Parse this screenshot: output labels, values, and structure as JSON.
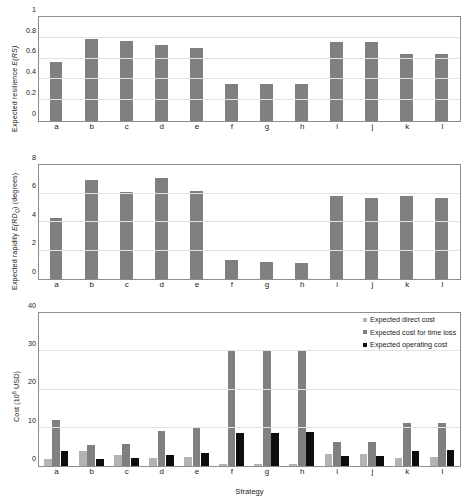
{
  "figure": {
    "xaxis_title": "Strategy",
    "categories": [
      "a",
      "b",
      "c",
      "d",
      "e",
      "f",
      "g",
      "h",
      "i",
      "j",
      "k",
      "l"
    ]
  },
  "colors": {
    "bar_gray": "#808080",
    "direct_cost": "#b3b3b3",
    "time_loss_cost": "#808080",
    "operating_cost": "#0d0d0d",
    "axis": "#8c8c8c",
    "grid": "#e2e2e2",
    "text": "#1a1a1a"
  },
  "panels": {
    "resilience": {
      "ylabel_parts": {
        "pre": "Expected resilience ",
        "ital": "E(RS)",
        "post": ""
      },
      "ticks": [
        "0",
        "0.2",
        "0.4",
        "0.6",
        "0.8",
        "1"
      ]
    },
    "rapidity": {
      "ylabel_parts": {
        "pre": "Expected rapidity ",
        "ital": "E(RD",
        "sub": "Q",
        "post": ") (degrees)"
      },
      "ticks": [
        "0",
        "2",
        "4",
        "6",
        "8"
      ]
    },
    "cost": {
      "ylabel_parts": {
        "pre": "Cost (10",
        "sup": "6",
        "post": " USD)"
      },
      "ticks": [
        "0",
        "10",
        "20",
        "30",
        "40"
      ]
    }
  },
  "legend": {
    "items": [
      {
        "label": "Expected direct cost",
        "color": "#b3b3b3"
      },
      {
        "label": "Expected cost for time loss",
        "color": "#808080"
      },
      {
        "label": "Expected operating cost",
        "color": "#0d0d0d"
      }
    ]
  },
  "chart_data": [
    {
      "type": "bar",
      "title": "Expected resilience by strategy",
      "xlabel": "",
      "ylabel": "Expected resilience E(RS)",
      "categories": [
        "a",
        "b",
        "c",
        "d",
        "e",
        "f",
        "g",
        "h",
        "i",
        "j",
        "k",
        "l"
      ],
      "values": [
        0.57,
        0.785,
        0.765,
        0.735,
        0.705,
        0.355,
        0.355,
        0.355,
        0.755,
        0.755,
        0.64,
        0.645
      ],
      "ylim": [
        0,
        1
      ],
      "yticks": [
        0,
        0.2,
        0.4,
        0.6,
        0.8,
        1
      ],
      "grid": true,
      "legend": "none",
      "series_color": "#808080"
    },
    {
      "type": "bar",
      "title": "Expected rapidity by strategy",
      "xlabel": "",
      "ylabel": "Expected rapidity E(RDQ) (degrees)",
      "categories": [
        "a",
        "b",
        "c",
        "d",
        "e",
        "f",
        "g",
        "h",
        "i",
        "j",
        "k",
        "l"
      ],
      "values": [
        4.3,
        6.95,
        6.1,
        7.1,
        6.2,
        1.3,
        1.2,
        1.1,
        5.8,
        5.7,
        5.8,
        5.7
      ],
      "ylim": [
        0,
        8
      ],
      "yticks": [
        0,
        2,
        4,
        6,
        8
      ],
      "grid": true,
      "legend": "none",
      "series_color": "#808080"
    },
    {
      "type": "bar",
      "title": "Cost by strategy",
      "xlabel": "Strategy",
      "ylabel": "Cost (10^6 USD)",
      "categories": [
        "a",
        "b",
        "c",
        "d",
        "e",
        "f",
        "g",
        "h",
        "i",
        "j",
        "k",
        "l"
      ],
      "series": [
        {
          "name": "Expected direct cost",
          "color": "#b3b3b3",
          "values": [
            1.9,
            3.9,
            3.0,
            2.2,
            2.4,
            0.5,
            0.5,
            0.6,
            3.2,
            3.2,
            2.2,
            2.3
          ]
        },
        {
          "name": "Expected cost for time loss",
          "color": "#808080",
          "values": [
            12.0,
            5.4,
            5.8,
            9.1,
            10.1,
            30.2,
            30.2,
            30.2,
            6.2,
            6.3,
            11.2,
            11.2
          ]
        },
        {
          "name": "Expected operating cost",
          "color": "#0d0d0d",
          "values": [
            4.0,
            1.9,
            2.2,
            2.8,
            3.5,
            8.7,
            8.7,
            8.8,
            2.5,
            2.5,
            4.0,
            4.1
          ]
        }
      ],
      "ylim": [
        0,
        40
      ],
      "yticks": [
        0,
        10,
        20,
        30,
        40
      ],
      "grid": true,
      "legend": "top-right"
    }
  ]
}
